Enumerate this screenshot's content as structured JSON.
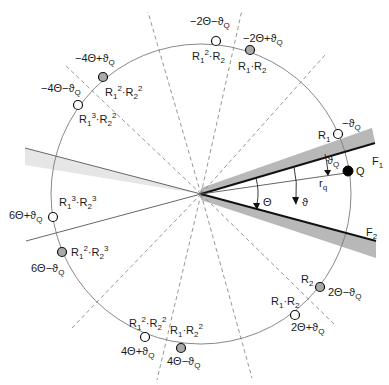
{
  "diagram": {
    "mirrors": {
      "upper": "F1",
      "lower": "F2"
    },
    "angles": {
      "wedge": "Θ",
      "source": "ϑ",
      "source_offset": "ϑQ",
      "radius": "rq"
    },
    "source": {
      "label": "Q"
    },
    "images": [
      {
        "id": "R1",
        "name": "R1",
        "angle": "−ϑQ",
        "style": "open"
      },
      {
        "id": "R2",
        "name": "R2",
        "angle": "2Θ−ϑQ",
        "style": "filled"
      },
      {
        "id": "R1R2_pos",
        "name": "R1·R2",
        "angle": "2Θ+ϑQ",
        "style": "open"
      },
      {
        "id": "R1sqR2",
        "name": "R1²·R2",
        "angle": "−2Θ−ϑQ",
        "style": "open"
      },
      {
        "id": "R1R2_neg",
        "name": "R1·R2",
        "angle": "−2Θ+ϑQ",
        "style": "filled"
      },
      {
        "id": "R1sqR2sq_neg",
        "name": "R1²·R2²",
        "angle": "−4Θ+ϑQ",
        "style": "filled"
      },
      {
        "id": "R1cuR2sq",
        "name": "R1³·R2²",
        "angle": "−4Θ−ϑQ",
        "style": "open"
      },
      {
        "id": "R1cuR2cu",
        "name": "R1³·R2³",
        "angle": "6Θ+ϑQ",
        "style": "open"
      },
      {
        "id": "R1sqR2cu",
        "name": "R1²·R2³",
        "angle": "6Θ−ϑQ",
        "style": "filled"
      },
      {
        "id": "R1sqR2sq_pos",
        "name": "R1²·R2²",
        "angle": "4Θ+ϑQ",
        "style": "open"
      },
      {
        "id": "R1R2sq",
        "name": "R1·R2²",
        "angle": "4Θ−ϑQ",
        "style": "filled"
      }
    ]
  },
  "text": {
    "F1": "F",
    "F1_sub": "1",
    "F2": "F",
    "F2_sub": "2",
    "Q": "Q",
    "theta_cap": "Θ",
    "theta": "ϑ",
    "thetaQ": "ϑ",
    "thetaQ_sub": "Q",
    "rq": "r",
    "rq_sub": "q",
    "R": "R",
    "s1": "1",
    "s2": "2",
    "p2": "2",
    "p3": "3",
    "dot": "·",
    "negThQ": "−ϑ",
    "a_2T_mTQ": "2Θ−ϑ",
    "a_2T_pTQ": "2Θ+ϑ",
    "a_m2T_mTQ": "−2Θ−ϑ",
    "a_m2T_pTQ": "−2Θ+ϑ",
    "a_m4T_pTQ": "−4Θ+ϑ",
    "a_m4T_mTQ": "−4Θ−ϑ",
    "a_6T_pTQ": "6Θ+ϑ",
    "a_6T_mTQ": "6Θ−ϑ",
    "a_4T_pTQ": "4Θ+ϑ",
    "a_4T_mTQ": "4Θ−ϑ",
    "Qsub": "Q"
  }
}
